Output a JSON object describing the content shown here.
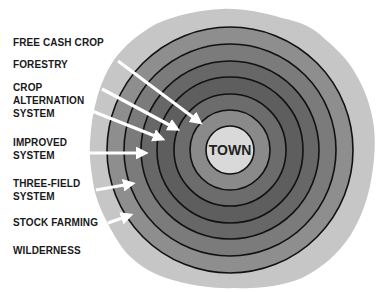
{
  "diagram": {
    "center_label": "TOWN",
    "zones": [
      {
        "lines": [
          "FREE CASH CROP"
        ],
        "top": 36
      },
      {
        "lines": [
          "FORESTRY"
        ],
        "top": 58
      },
      {
        "lines": [
          "CROP",
          "ALTERNATION",
          "SYSTEM"
        ],
        "top": 81
      },
      {
        "lines": [
          "IMPROVED",
          "SYSTEM"
        ],
        "top": 136
      },
      {
        "lines": [
          "THREE-FIELD",
          "SYSTEM"
        ],
        "top": 177
      },
      {
        "lines": [
          "STOCK FARMING"
        ],
        "top": 216
      },
      {
        "lines": [
          "WILDERNESS"
        ],
        "top": 244
      }
    ],
    "colors": {
      "wilderness": "#c6c6c6",
      "ring6": "#8e8e8e",
      "ring5": "#7b7b7b",
      "ring4": "#676767",
      "ring3": "#5e5e5e",
      "ring2": "#6c6c6c",
      "ring1": "#8a8a8a",
      "town": "#d9d9d9",
      "ring_stroke": "#111111",
      "arrow": "#ffffff"
    }
  }
}
